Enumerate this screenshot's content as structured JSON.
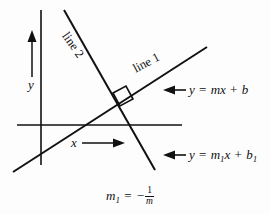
{
  "figure": {
    "background_color": "#fdfdfd",
    "ink_color": "#111111"
  },
  "axes": {
    "x_axis_label": "x",
    "y_axis_label": "y",
    "x_arrow_icon": "arrow-right-icon",
    "y_arrow_icon": "arrow-up-icon"
  },
  "lines": [
    {
      "name": "line 1",
      "label": "line 1",
      "equation": "y = mx + b",
      "equation_parts": {
        "lhs": "y",
        "equals": "=",
        "slope_var": "m",
        "x_var": "x",
        "plus": "+",
        "intercept_var": "b"
      },
      "callout_icon": "arrow-left-icon"
    },
    {
      "name": "line 2",
      "label": "line 2",
      "equation": "y = m1x + b1",
      "equation_parts": {
        "lhs": "y",
        "equals": "=",
        "slope_var": "m",
        "slope_sub": "1",
        "x_var": "x",
        "plus": "+",
        "intercept_var": "b",
        "intercept_sub": "1"
      },
      "callout_icon": "arrow-left-icon"
    }
  ],
  "right_angle_marker": {
    "name": "right-angle-marker",
    "meaning": "perpendicular"
  },
  "slope_relation": {
    "text": "m1 = -1/m",
    "lhs_var": "m",
    "lhs_sub": "1",
    "equals": "=",
    "minus": "−",
    "numerator": "1",
    "denominator": "m"
  }
}
